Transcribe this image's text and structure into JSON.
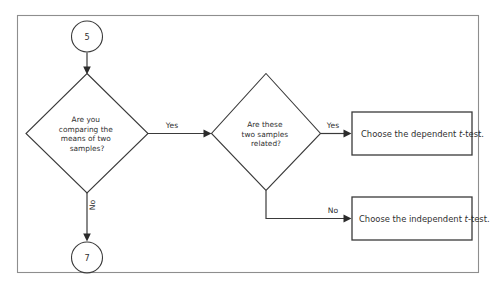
{
  "diagram": {
    "type": "flowchart",
    "title": "",
    "border_color": "#8e8e8e",
    "line_color": "#3a3a3a",
    "text_color": "#2f2f2f",
    "background": "#ffffff"
  },
  "terminals": {
    "start": {
      "label": "5",
      "shape": "circle"
    },
    "exit": {
      "label": "7",
      "shape": "circle"
    }
  },
  "decisions": [
    {
      "id": "decision-means-two-samples",
      "shape": "diamond",
      "lines": [
        "Are you",
        "comparing the",
        "means of two",
        "samples?"
      ]
    },
    {
      "id": "decision-samples-related",
      "shape": "diamond",
      "lines": [
        "Are these",
        "two samples",
        "related?"
      ]
    }
  ],
  "outcomes": [
    {
      "id": "outcome-dependent-t-test",
      "shape": "rectangle",
      "prefix": "Choose the dependent ",
      "italic": "t",
      "suffix": "-test."
    },
    {
      "id": "outcome-independent-t-test",
      "shape": "rectangle",
      "prefix": "Choose the independent ",
      "italic": "t",
      "suffix": "-test."
    }
  ],
  "edge_labels": {
    "means_yes": "Yes",
    "means_no": "No",
    "related_yes": "Yes",
    "related_no": "No"
  }
}
